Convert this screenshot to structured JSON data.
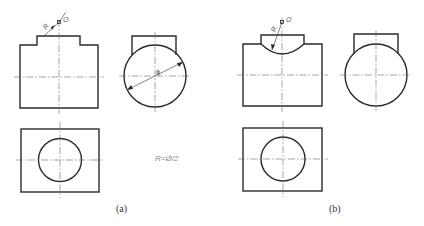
{
  "figure": {
    "panels": [
      {
        "id": "a",
        "caption": "(a)",
        "front_view": {
          "dim_radius_label": "R",
          "center_point_label": "O"
        },
        "side_view": {
          "dim_diameter_label": "ϕ"
        },
        "note": "R=Ø/2"
      },
      {
        "id": "b",
        "caption": "(b)",
        "front_view": {
          "dim_radius_label": "R",
          "center_point_label": "O"
        }
      }
    ]
  },
  "colors": {
    "outline": "#2a2a2a",
    "centerline": "#6a6a6a",
    "note_text": "#8a8a8a"
  }
}
